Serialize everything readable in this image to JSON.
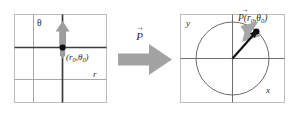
{
  "figure": {
    "colors": {
      "background": "#ffffff",
      "panel_border": "#b8b8b8",
      "grid_line": "#9a9a9a",
      "axis_dark": "#3a3a3a",
      "block_arrow": "#a0a0a0",
      "small_arrow": "#8f8f8f",
      "vector": "#111111",
      "point": "#111111",
      "circle": "#6b6b6b",
      "text": "#2b2b2b"
    },
    "left_panel": {
      "name": "polar-grid-panel",
      "theta_axis_label": "θ",
      "r_axis_label": "r",
      "point_label": "(r",
      "point_label_sub1": "0",
      "point_label_mid": ",θ",
      "point_label_sub2": "0",
      "point_label_end": ")"
    },
    "middle": {
      "name": "transform-arrow",
      "vector_label": "P",
      "vector_accent": "→"
    },
    "right_panel": {
      "name": "cartesian-circle-panel",
      "y_axis_label": "y",
      "x_axis_label": "x",
      "point_label": "P",
      "point_label_accent": "→",
      "point_label_args": "(r",
      "point_label_sub1": "0",
      "point_label_mid": ",θ",
      "point_label_sub2": "0",
      "point_label_end": ")"
    }
  }
}
